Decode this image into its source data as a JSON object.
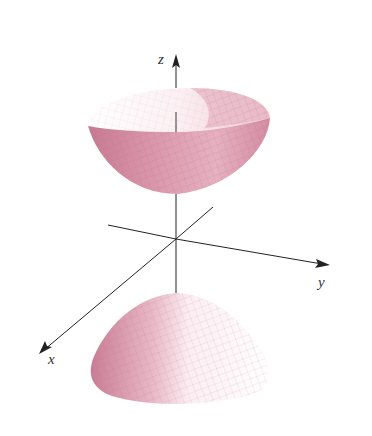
{
  "figure": {
    "type": "hyperboloid of two sheets",
    "axes": {
      "x": {
        "label": "x"
      },
      "y": {
        "label": "y"
      },
      "z": {
        "label": "z"
      }
    },
    "colors": {
      "surface_light": "#f6dfe6",
      "surface_mid": "#e2aabb",
      "surface_dark": "#c77a92",
      "grid": "#b8687f",
      "axis": "#222222"
    }
  }
}
